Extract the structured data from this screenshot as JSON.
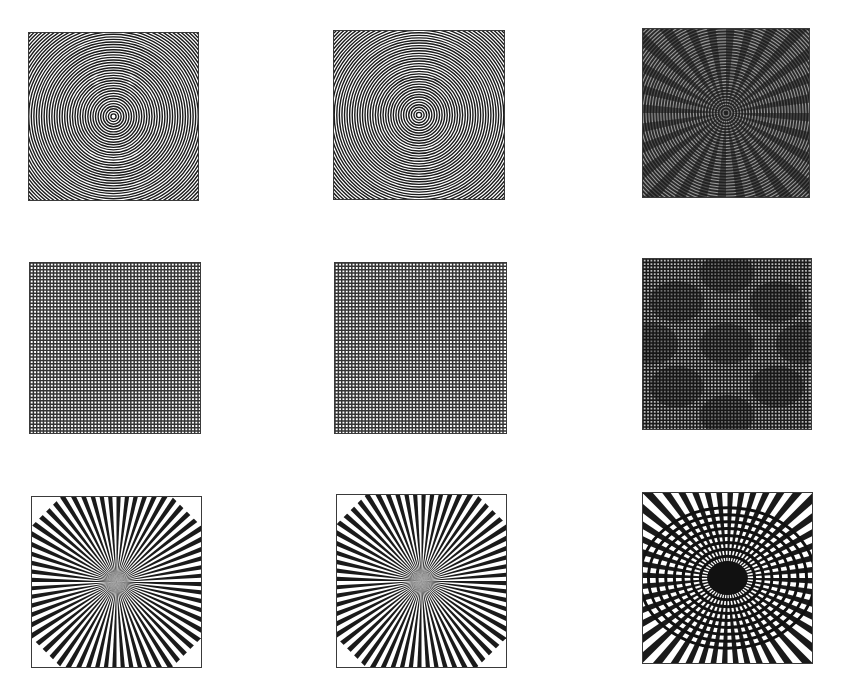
{
  "figure": {
    "layout": {
      "rows": 3,
      "columns": 3
    },
    "colors": {
      "ink": "#1a1a1a",
      "border": "#3a3a3a",
      "background": "#ffffff"
    },
    "panels": [
      {
        "row": 1,
        "col": 1,
        "pattern": "concentric-circles",
        "variant": "original",
        "box": [
          28,
          32,
          171,
          169
        ]
      },
      {
        "row": 1,
        "col": 2,
        "pattern": "concentric-circles",
        "variant": "reconstructed",
        "box": [
          333,
          30,
          172,
          170
        ]
      },
      {
        "row": 1,
        "col": 3,
        "pattern": "concentric-circles",
        "variant": "aliased-moire",
        "box": [
          642,
          28,
          168,
          170
        ]
      },
      {
        "row": 2,
        "col": 1,
        "pattern": "square-grid",
        "variant": "original",
        "box": [
          29,
          262,
          172,
          172
        ]
      },
      {
        "row": 2,
        "col": 2,
        "pattern": "square-grid",
        "variant": "reconstructed",
        "box": [
          334,
          262,
          173,
          172
        ]
      },
      {
        "row": 2,
        "col": 3,
        "pattern": "square-grid",
        "variant": "aliased-moire",
        "box": [
          642,
          258,
          170,
          172
        ]
      },
      {
        "row": 3,
        "col": 1,
        "pattern": "siemens-star",
        "variant": "original",
        "box": [
          31,
          496,
          171,
          172
        ]
      },
      {
        "row": 3,
        "col": 2,
        "pattern": "siemens-star",
        "variant": "reconstructed",
        "box": [
          336,
          494,
          171,
          174
        ]
      },
      {
        "row": 3,
        "col": 3,
        "pattern": "siemens-star",
        "variant": "aliased-moire",
        "box": [
          642,
          492,
          171,
          172
        ]
      }
    ]
  }
}
